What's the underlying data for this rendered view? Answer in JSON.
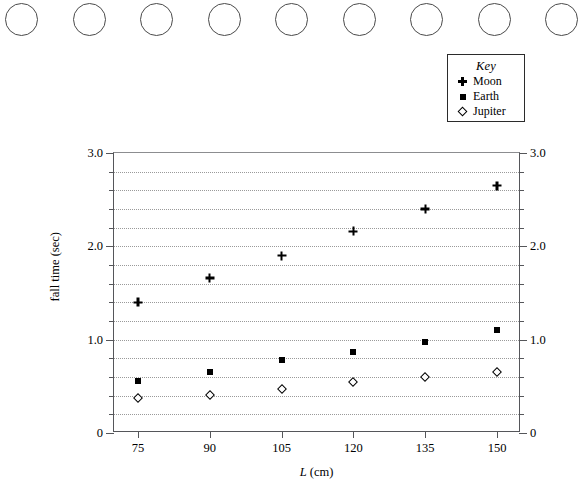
{
  "page": {
    "background": "#ffffff",
    "ink": "#000000",
    "axis_color": "#55565a",
    "grid_color": "#9a9a9a"
  },
  "punch_row": {
    "name": "circle-row",
    "count": 9,
    "circles": [
      {
        "label": "circle-1"
      },
      {
        "label": "circle-2"
      },
      {
        "label": "circle-3"
      },
      {
        "label": "circle-4"
      },
      {
        "label": "circle-5"
      },
      {
        "label": "circle-6"
      },
      {
        "label": "circle-7"
      },
      {
        "label": "circle-8"
      },
      {
        "label": "circle-9"
      }
    ]
  },
  "legend": {
    "title": "Key",
    "entries": [
      {
        "marker": "plus-marker",
        "label": "Moon"
      },
      {
        "marker": "square-marker",
        "label": "Earth"
      },
      {
        "marker": "diamond-marker",
        "label": "Jupiter"
      }
    ]
  },
  "chart_data": {
    "type": "scatter",
    "title": "",
    "xlabel": "L (cm)",
    "xlabel_italic_part": "L",
    "xlabel_rest": " (cm)",
    "ylabel": "fall time (sec)",
    "xlim": [
      70,
      155
    ],
    "ylim": [
      0,
      3.0
    ],
    "grid": true,
    "grid_axis": "y",
    "grid_step": 0.2,
    "legend_position": "top-right-outside",
    "x_ticks": [
      75,
      90,
      105,
      120,
      135,
      150
    ],
    "x_tick_labels": [
      "75",
      "90",
      "105",
      "120",
      "135",
      "150"
    ],
    "y_ticks_major": [
      0,
      1.0,
      2.0,
      3.0
    ],
    "y_tick_labels_left": [
      "0",
      "1.0",
      "2.0",
      "3.0"
    ],
    "y_tick_labels_right": [
      "0",
      "1.0",
      "2.0",
      "3.0"
    ],
    "y_ticks_minor_step": 0.2,
    "dual_y_axis": true,
    "x": [
      75,
      90,
      105,
      120,
      135,
      150
    ],
    "series": [
      {
        "name": "Moon",
        "marker": "plus-marker",
        "values": [
          1.4,
          1.66,
          1.9,
          2.16,
          2.4,
          2.65
        ]
      },
      {
        "name": "Earth",
        "marker": "square-marker",
        "values": [
          0.56,
          0.65,
          0.78,
          0.87,
          0.97,
          1.1
        ]
      },
      {
        "name": "Jupiter",
        "marker": "diamond-marker",
        "values": [
          0.38,
          0.41,
          0.47,
          0.55,
          0.6,
          0.65
        ]
      }
    ]
  }
}
